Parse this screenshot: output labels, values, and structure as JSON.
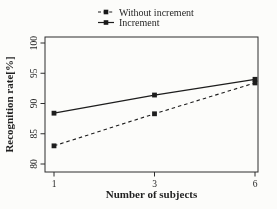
{
  "figure": {
    "background": "#fcfcfa",
    "ink": "#1a1a1a"
  },
  "chart_data": {
    "type": "line",
    "title": "",
    "xlabel": "Number of subjects",
    "ylabel": "Recognition rate[%]",
    "x": [
      1,
      3,
      6
    ],
    "xtick_labels": [
      "1",
      "3",
      "6"
    ],
    "yticks": [
      80,
      85,
      90,
      95,
      100
    ],
    "ytick_labels": [
      "80",
      "85",
      "90",
      "95",
      "100"
    ],
    "ylim": [
      80,
      100
    ],
    "x_spacing": "equal",
    "grid": false,
    "legend_position": "above-plot-top-center",
    "series": [
      {
        "name": "Without increment",
        "line_style": "dashed",
        "marker": "filled-square",
        "color": "#1a1a1a",
        "values": [
          83.0,
          88.3,
          93.4
        ]
      },
      {
        "name": "Increment",
        "line_style": "solid",
        "marker": "filled-square",
        "color": "#1a1a1a",
        "values": [
          88.4,
          91.4,
          94.0
        ]
      }
    ]
  }
}
